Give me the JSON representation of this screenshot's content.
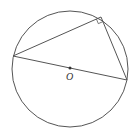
{
  "diagram": {
    "type": "geometry",
    "colors": {
      "stroke": "#555555",
      "background": "#ffffff",
      "label": "#333333"
    },
    "circle": {
      "cx": 70,
      "cy": 69,
      "r": 58
    },
    "center": {
      "x": 70,
      "y": 68,
      "label": "O"
    },
    "points": {
      "left": {
        "x": 13,
        "y": 56
      },
      "top": {
        "x": 101,
        "y": 17
      },
      "right": {
        "x": 127,
        "y": 80
      }
    },
    "right_angle_marker": {
      "at": "top",
      "size": 5
    }
  }
}
